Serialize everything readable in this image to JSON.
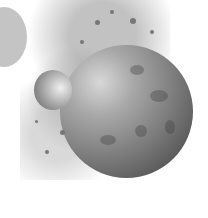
{
  "image": {
    "description": "Grayscale illustration of a large cratered planet with a smaller moon and an exploding spray of debris, plus a flat gray circle at top-left",
    "palette": {
      "background": "#ffffff",
      "flat_circle": "#c4c4c4",
      "planet_dark": "#5a5a5a",
      "planet_light": "#d8d8d8"
    },
    "objects": [
      {
        "name": "flat-gray-circle",
        "cx": 4,
        "cy": 37,
        "r": 30
      },
      {
        "name": "large-planet",
        "cx": 126,
        "cy": 111,
        "r": 66
      },
      {
        "name": "small-moon",
        "cx": 53,
        "cy": 90,
        "r": 19
      },
      {
        "name": "debris-spray",
        "region": "upper-center from moon toward top-right"
      }
    ]
  }
}
